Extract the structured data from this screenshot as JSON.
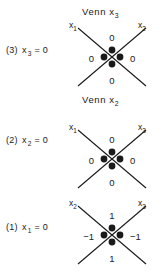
{
  "figure": {
    "background_color": "#ffffff",
    "ink_color": "#1a1a1a"
  },
  "panels": [
    {
      "id": "panel-3",
      "title_prefix": "Venn x",
      "title_subscript": "3",
      "row_index": "(3)",
      "row_variable": "x",
      "row_subscript": "3",
      "row_equals": "= 0",
      "axis_top_left_var": "x",
      "axis_top_left_sub": "1",
      "axis_top_right_var": "x",
      "axis_top_right_sub": "2",
      "value_top": "0",
      "value_bottom": "0",
      "value_left": "0",
      "value_right": "0",
      "dot_count": 4
    },
    {
      "id": "panel-2",
      "title_prefix": "Venn x",
      "title_subscript": "2",
      "row_index": "(2)",
      "row_variable": "x",
      "row_subscript": "2",
      "row_equals": "= 0",
      "axis_top_left_var": "x",
      "axis_top_left_sub": "1",
      "axis_top_right_var": "x",
      "axis_top_right_sub": "3",
      "value_top": "0",
      "value_bottom": "0",
      "value_left": "0",
      "value_right": "0",
      "dot_count": 4
    },
    {
      "id": "panel-1",
      "title_prefix": "",
      "title_subscript": "",
      "row_index": "(1)",
      "row_variable": "x",
      "row_subscript": "1",
      "row_equals": "= 0",
      "axis_top_left_var": "x",
      "axis_top_left_sub": "2",
      "axis_top_right_var": "x",
      "axis_top_right_sub": "3",
      "value_top": "1",
      "value_bottom": "1",
      "value_left": "−1",
      "value_right": "−1",
      "dot_count": 4
    }
  ]
}
